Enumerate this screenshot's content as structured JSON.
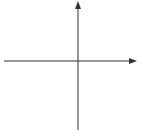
{
  "chart_data": {
    "type": "line",
    "title": "",
    "xlabel": "x",
    "ylabel": "y",
    "xlim": [
      -6,
      4
    ],
    "ylim": [
      -5.8,
      4.5
    ],
    "grid": true,
    "x_tick_labels": [
      "−5",
      "−4",
      "−2",
      "−1",
      "1",
      "2",
      "3"
    ],
    "x_tick_values": [
      -5,
      -4,
      -2,
      -1,
      1,
      2,
      3
    ],
    "y_tick_labels": [
      "3",
      "2",
      "1",
      "−1",
      "−3",
      "−4",
      "−5"
    ],
    "y_tick_values": [
      3,
      2,
      1,
      -1,
      -3,
      -4,
      -5
    ],
    "series": [
      {
        "name": "line",
        "x": [
          -6,
          4
        ],
        "y": [
          1,
          -4
        ],
        "equation": "y = -x/2 - 2",
        "marked_points": [
          {
            "x": -4,
            "y": 0
          },
          {
            "x": 0,
            "y": -2
          },
          {
            "x": 2,
            "y": -3
          }
        ],
        "color": "#555555",
        "arrows": "both"
      }
    ]
  },
  "labels": {
    "x_axis": "x",
    "y_axis": "y"
  }
}
